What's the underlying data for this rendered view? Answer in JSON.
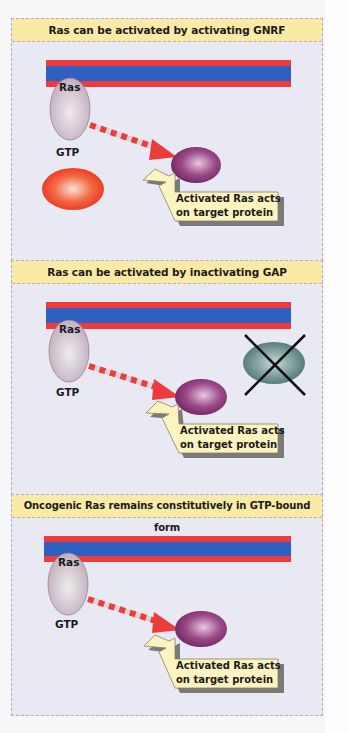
{
  "figure": {
    "panels": [
      {
        "title": "Ras can be activated by activating GNRF",
        "ras_label": "Ras",
        "gtp_label": "GTP",
        "callout": [
          "Activated Ras acts",
          "on target protein"
        ],
        "extra_protein": "GNRF (active, red-orange)",
        "extra_protein_crossed": false
      },
      {
        "title": "Ras can be activated by inactivating GAP",
        "ras_label": "Ras",
        "gtp_label": "GTP",
        "callout": [
          "Activated Ras acts",
          "on target protein"
        ],
        "extra_protein": "GAP (inactivated, teal-gray)",
        "extra_protein_crossed": true
      },
      {
        "title": "Oncogenic Ras remains constitutively in GTP-bound form",
        "ras_label": "Ras",
        "gtp_label": "GTP",
        "callout": [
          "Activated Ras acts",
          "on target protein"
        ],
        "extra_protein": null,
        "extra_protein_crossed": false
      }
    ],
    "colors": {
      "membrane_red": "#ee3b3b",
      "membrane_blue": "#2f5fc0",
      "header_bg": "#f9eaa6",
      "panel_bg": "#e9e9f3",
      "ras": "#cbb9c6",
      "target_protein": "#8c3a78",
      "gnrf": "#f24a24",
      "gap": "#5f8a88",
      "callout_bg": "#fbf4c0"
    }
  }
}
